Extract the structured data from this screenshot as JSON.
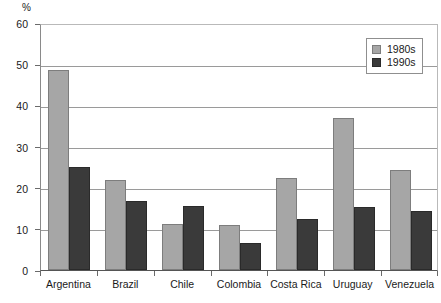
{
  "chart_data": {
    "type": "bar",
    "title": "",
    "xlabel": "",
    "ylabel": "%",
    "ylim": [
      0,
      60
    ],
    "yticks": [
      0,
      10,
      20,
      30,
      40,
      50,
      60
    ],
    "grid": true,
    "legend_position": "top-right",
    "categories": [
      "Argentina",
      "Brazil",
      "Chile",
      "Colombia",
      "Costa Rica",
      "Uruguay",
      "Venezuela"
    ],
    "series": [
      {
        "name": "1980s",
        "color": "#a6a6a6",
        "values": [
          48.5,
          21.8,
          11.2,
          11.0,
          22.3,
          37.0,
          24.3
        ]
      },
      {
        "name": "1990s",
        "color": "#3a3a3a",
        "values": [
          25.0,
          16.7,
          15.5,
          6.6,
          12.5,
          15.3,
          14.3
        ]
      }
    ]
  },
  "axis": {
    "unit_label": "%",
    "tick_labels": [
      "60",
      "50",
      "40",
      "30",
      "20",
      "10",
      "0"
    ]
  },
  "legend": {
    "items": [
      {
        "label": "1980s"
      },
      {
        "label": "1990s"
      }
    ]
  }
}
